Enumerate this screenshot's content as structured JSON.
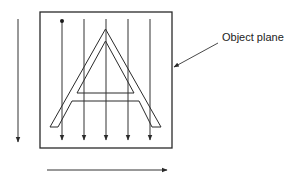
{
  "diagram": {
    "title": "",
    "labels": {
      "object_plane": "Object plane"
    },
    "colors": {
      "stroke": "#2a2a2a",
      "background": "#ffffff"
    },
    "elements": {
      "object_plane_box": {
        "x": 40,
        "y": 12,
        "width": 132,
        "height": 136
      },
      "scan_lines_x": [
        62,
        84,
        106,
        128,
        150
      ],
      "start_dot": {
        "x": 62,
        "y": 21
      },
      "scan_direction_arrow": "vertical-down (left of plane)",
      "raster_advance_arrow": "horizontal-right (below plane)",
      "letter": "A"
    }
  }
}
